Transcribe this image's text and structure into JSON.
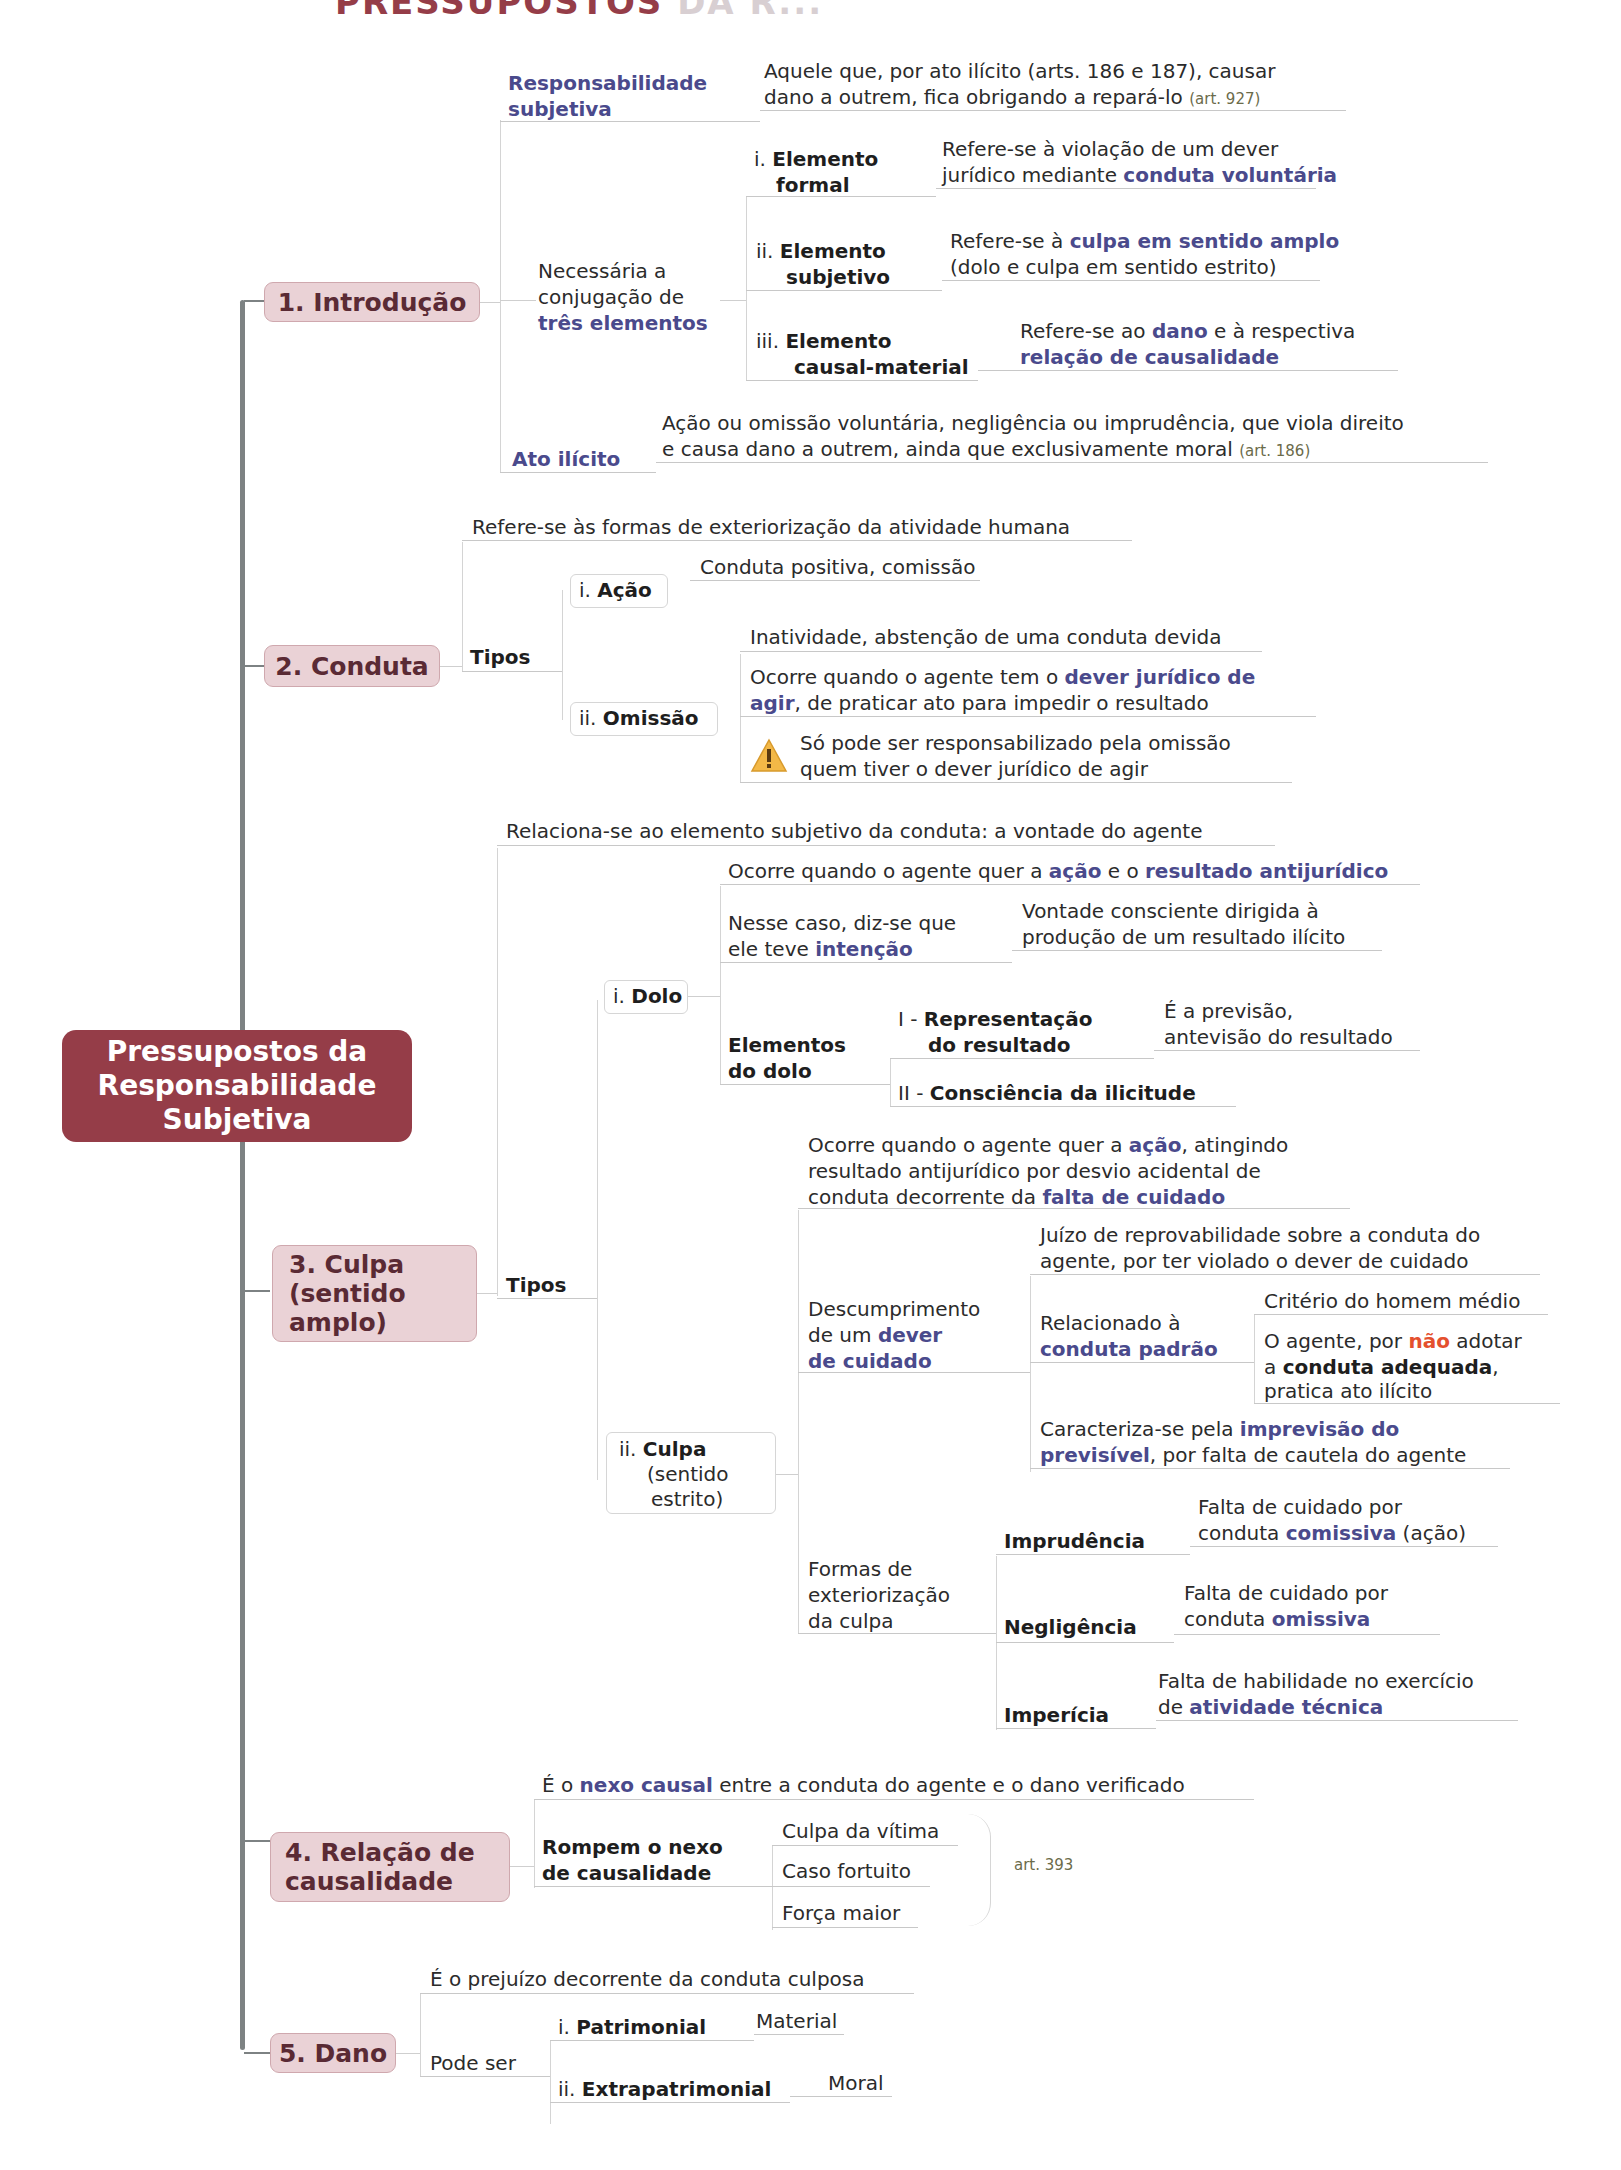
{
  "header": {
    "visible_part": "PRESSUPOSTOS",
    "faded_part": "DA R..."
  },
  "central": {
    "label": "Pressupostos da\nResponsabilidade\nSubjetiva"
  },
  "colors": {
    "central": "#953d48",
    "topic_bg": "#ead2d6",
    "topic_text": "#5a2a34",
    "highlight": "#4a4a8c",
    "warning": "#e4502e"
  },
  "topics": [
    {
      "label": "1. Introdução"
    },
    {
      "label": "2. Conduta"
    },
    {
      "label": "3. Culpa\n  (sentido\n  amplo)"
    },
    {
      "label": "4. Relação de\n  causalidade"
    },
    {
      "label": "5. Dano"
    }
  ],
  "intro": {
    "resp_subj": {
      "label_1": "Responsabilidade",
      "label_2": "subjetiva",
      "desc_1": "Aquele que, por ato ilícito (arts. 186 e 187), causar",
      "desc_2": "dano a outrem, fica obrigando a repará-lo ",
      "ref": "(art. 927)"
    },
    "conj": {
      "line_1": "Necessária a",
      "line_2": "conjugação de",
      "line_3": "três elementos"
    },
    "elements": [
      {
        "num": "i. ",
        "name_1": "Elemento",
        "name_2": "formal",
        "desc_1": "Refere-se à violação de um dever",
        "desc_2a": "jurídico mediante ",
        "desc_2b": "conduta voluntária"
      },
      {
        "num": "ii. ",
        "name_1": "Elemento",
        "name_2": "subjetivo",
        "desc_1a": "Refere-se à ",
        "desc_1b": "culpa em sentido amplo",
        "desc_2": "(dolo e culpa em sentido estrito)"
      },
      {
        "num": "iii. ",
        "name_1": "Elemento",
        "name_2": "causal-material",
        "desc_1a": "Refere-se ao ",
        "desc_1b": "dano",
        "desc_1c": " e à respectiva",
        "desc_2": "relação de causalidade"
      }
    ],
    "ato": {
      "label": "Ato ilícito",
      "desc_1": "Ação ou omissão voluntária, negligência ou imprudência, que viola direito",
      "desc_2": "e causa dano a outrem, ainda que exclusivamente moral ",
      "ref": "(art. 186)"
    }
  },
  "conduta": {
    "desc": "Refere-se às formas de exteriorização da atividade humana",
    "tipos": "Tipos",
    "acao": {
      "num": "i. ",
      "name": "Ação",
      "desc": "Conduta positiva, comissão"
    },
    "omissao": {
      "num": "ii. ",
      "name": "Omissão",
      "desc_1": "Inatividade, abstenção de uma conduta devida",
      "desc_2a": "Ocorre quando o agente tem o ",
      "desc_2b": "dever jurídico de",
      "desc_3a": "agir",
      "desc_3b": ", de praticar ato para impedir o resultado",
      "warn_1": "Só pode ser responsabilizado  pela omissão",
      "warn_2": "quem tiver o dever jurídico de agir",
      "warn_icon": "warning-icon"
    }
  },
  "culpa": {
    "desc": "Relaciona-se ao elemento subjetivo da conduta: a vontade do agente",
    "tipos": "Tipos",
    "dolo": {
      "num": "i. ",
      "name": "Dolo",
      "desc_a": "Ocorre quando o agente quer a ",
      "desc_b": "ação",
      "desc_c": " e o ",
      "desc_d": "resultado antijurídico",
      "int_1": "Nesse caso, diz-se que",
      "int_2a": "ele teve ",
      "int_2b": "intenção",
      "vont_1": "Vontade consciente dirigida à",
      "vont_2": "produção de um resultado ilícito",
      "elem_1": "Elementos",
      "elem_2": "do dolo",
      "rep_num": "I - ",
      "rep_1": "Representação",
      "rep_2": "do resultado",
      "prev_1": "É a previsão,",
      "prev_2": "antevisão do resultado",
      "cons_num": "II - ",
      "cons": "Consciência da ilicitude"
    },
    "culpa_estrito": {
      "num": "ii. ",
      "name": "Culpa",
      "sub_1": "(sentido",
      "sub_2": "estrito)",
      "desc_1a": "Ocorre quando o agente quer a ",
      "desc_1b": "ação",
      "desc_1c": ", atingindo",
      "desc_2": "resultado antijurídico por desvio acidental de",
      "desc_3a": "conduta decorrente da ",
      "desc_3b": "falta de cuidado",
      "desc_dever_1": "Descumprimento",
      "desc_dever_2a": "de um ",
      "desc_dever_2b": "dever",
      "desc_dever_3": "de cuidado",
      "juizo_1": "Juízo de reprovabilidade sobre a conduta do",
      "juizo_2": "agente, por ter violado o dever de cuidado",
      "rel_1": "Relacionado à",
      "rel_2": "conduta padrão",
      "criterio": "Critério do homem médio",
      "agente_1a": "O agente, por ",
      "agente_1b": "não",
      "agente_1c": " adotar",
      "agente_2a": "a ",
      "agente_2b": "conduta adequada",
      "agente_2c": ",",
      "agente_3": "pratica ato ilícito",
      "carac_1a": "Caracteriza-se pela ",
      "carac_1b": "imprevisão do",
      "carac_2a": "previsível",
      "carac_2b": ", por falta de cautela do agente",
      "formas_1": "Formas de",
      "formas_2": "exteriorização",
      "formas_3": "da culpa",
      "forms": [
        {
          "name": "Imprudência",
          "d1": "Falta de cuidado por",
          "d2a": "conduta ",
          "d2b": "comissiva",
          "d2c": " (ação)"
        },
        {
          "name": "Negligência",
          "d1": "Falta de cuidado por",
          "d2a": "conduta ",
          "d2b": "omissiva",
          "d2c": ""
        },
        {
          "name": "Imperícia",
          "d1": "Falta de habilidade no exercício",
          "d2a": "de ",
          "d2b": "atividade técnica",
          "d2c": ""
        }
      ]
    }
  },
  "relacao": {
    "desc_a": "É o ",
    "desc_b": "nexo causal",
    "desc_c": " entre a conduta do agente e o dano verificado",
    "rompem_1": "Rompem o nexo",
    "rompem_2": "de causalidade",
    "items": [
      "Culpa da vítima",
      "Caso fortuito",
      "Força maior"
    ],
    "ref": "art. 393"
  },
  "dano": {
    "desc": "É o prejuízo decorrente da conduta culposa",
    "pode": "Pode ser",
    "patr_num": "i. ",
    "patr": "Patrimonial",
    "patr_desc": "Material",
    "extra_num": "ii. ",
    "extra": "Extrapatrimonial",
    "extra_desc": "Moral"
  }
}
